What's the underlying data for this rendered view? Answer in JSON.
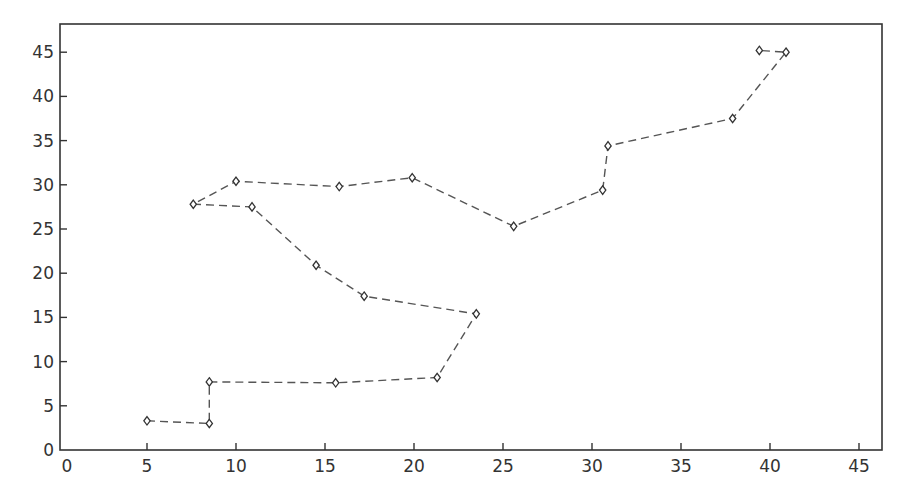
{
  "chart_data": {
    "type": "line",
    "title": "",
    "xlabel": "",
    "ylabel": "",
    "xlim": [
      0,
      46.3
    ],
    "ylim": [
      0,
      48
    ],
    "x_ticks": [
      0,
      5,
      10,
      15,
      20,
      25,
      30,
      35,
      40,
      45
    ],
    "y_ticks": [
      0,
      5,
      10,
      15,
      20,
      25,
      30,
      35,
      40,
      45
    ],
    "grid": false,
    "legend": null,
    "series": [
      {
        "name": "path",
        "line_style": "dashed",
        "marker": "diamond",
        "color": "#555555",
        "points": [
          {
            "x": 5.0,
            "y": 3.3
          },
          {
            "x": 8.5,
            "y": 3.0
          },
          {
            "x": 8.5,
            "y": 7.7
          },
          {
            "x": 15.6,
            "y": 7.6
          },
          {
            "x": 21.3,
            "y": 8.2
          },
          {
            "x": 23.5,
            "y": 15.4
          },
          {
            "x": 17.2,
            "y": 17.4
          },
          {
            "x": 14.5,
            "y": 20.9
          },
          {
            "x": 10.9,
            "y": 27.5
          },
          {
            "x": 7.6,
            "y": 27.8
          },
          {
            "x": 10.0,
            "y": 30.4
          },
          {
            "x": 15.8,
            "y": 29.8
          },
          {
            "x": 19.9,
            "y": 30.8
          },
          {
            "x": 25.6,
            "y": 25.3
          },
          {
            "x": 30.6,
            "y": 29.4
          },
          {
            "x": 30.9,
            "y": 34.4
          },
          {
            "x": 37.9,
            "y": 37.5
          },
          {
            "x": 40.9,
            "y": 45.0
          },
          {
            "x": 39.4,
            "y": 45.2
          }
        ]
      }
    ]
  },
  "layout": {
    "frame": {
      "left": 60,
      "top": 24,
      "right": 882,
      "bottom": 450
    },
    "x_origin_px": 58,
    "x_px_per_unit": 17.8,
    "y_origin_px": 450,
    "y_px_per_unit": 8.84,
    "axis_color": "#333333",
    "line_color": "#555555",
    "marker_color": "#333333"
  }
}
